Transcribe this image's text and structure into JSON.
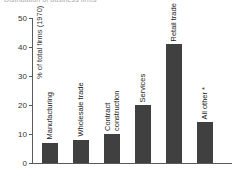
{
  "title_sliver": "Distribution of business firms",
  "chart_data": {
    "type": "bar",
    "title": "Distribution of business firms",
    "xlabel": "",
    "ylabel": "% of total firms (1970)",
    "ylim": [
      0,
      50
    ],
    "yticks": [
      0,
      10,
      20,
      30,
      40,
      50
    ],
    "grid": false,
    "legend": null,
    "bar_color": "#404040",
    "axis_color": "#5a5a5a",
    "categories": [
      "Manufacturing",
      "Wholesale trade",
      "Contract construction",
      "Services",
      "Retail trade",
      "All other *"
    ],
    "values": [
      7,
      8,
      10,
      20,
      41,
      14
    ],
    "annotations": [
      "Bar labels are rotated 90 degrees and placed above each bar."
    ]
  }
}
